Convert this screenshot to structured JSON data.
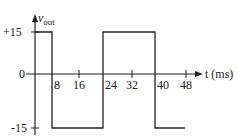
{
  "diagram": {
    "y_axis": {
      "label_main": "v",
      "label_sub": "out",
      "ticks": [
        "+15",
        "0",
        "-15"
      ]
    },
    "x_axis": {
      "label": "t (ms)",
      "ticks": [
        "8",
        "16",
        "24",
        "32",
        "40",
        "48"
      ]
    },
    "waveform": {
      "type": "square",
      "levels": [
        15,
        -15
      ],
      "segments": [
        {
          "from_ms": 0,
          "to_ms": 8,
          "value": 15
        },
        {
          "from_ms": 8,
          "to_ms": 24,
          "value": -15
        },
        {
          "from_ms": 24,
          "to_ms": 40,
          "value": 15
        },
        {
          "from_ms": 40,
          "to_ms": 48,
          "value": -15
        }
      ]
    },
    "colors": {
      "line": "#222222",
      "background": "#ffffff"
    }
  }
}
